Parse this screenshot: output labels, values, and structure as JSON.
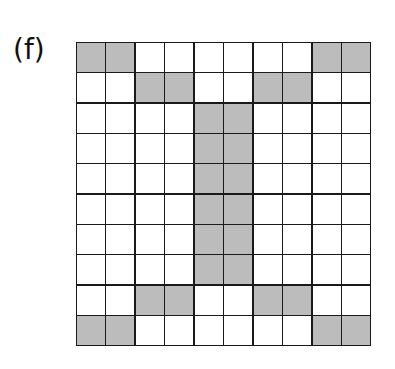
{
  "figure": {
    "label": "(f)",
    "rows": 10,
    "cols": 10,
    "colors": {
      "filled": "#bcbcbc",
      "empty": "#ffffff",
      "line": "#1a1a1a"
    },
    "grid": [
      [
        1,
        1,
        0,
        0,
        0,
        0,
        0,
        0,
        1,
        1
      ],
      [
        0,
        0,
        1,
        1,
        0,
        0,
        1,
        1,
        0,
        0
      ],
      [
        0,
        0,
        0,
        0,
        1,
        1,
        0,
        0,
        0,
        0
      ],
      [
        0,
        0,
        0,
        0,
        1,
        1,
        0,
        0,
        0,
        0
      ],
      [
        0,
        0,
        0,
        0,
        1,
        1,
        0,
        0,
        0,
        0
      ],
      [
        0,
        0,
        0,
        0,
        1,
        1,
        0,
        0,
        0,
        0
      ],
      [
        0,
        0,
        0,
        0,
        1,
        1,
        0,
        0,
        0,
        0
      ],
      [
        0,
        0,
        0,
        0,
        1,
        1,
        0,
        0,
        0,
        0
      ],
      [
        0,
        0,
        1,
        1,
        0,
        0,
        1,
        1,
        0,
        0
      ],
      [
        1,
        1,
        0,
        0,
        0,
        0,
        0,
        0,
        1,
        1
      ]
    ]
  }
}
